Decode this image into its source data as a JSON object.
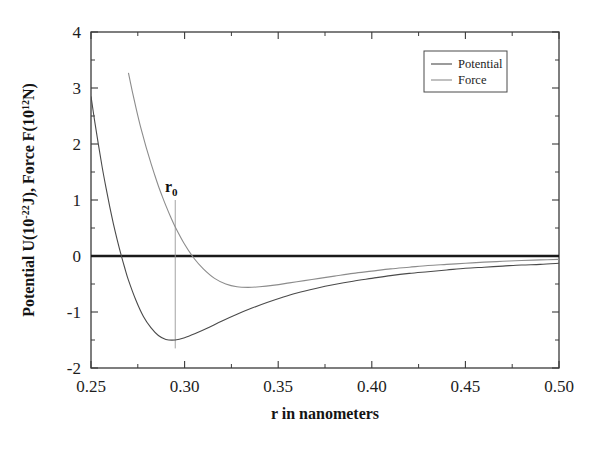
{
  "figure": {
    "background": "#ffffff",
    "frame_color": "#3a3a3a",
    "annotation": {
      "label": "r",
      "sub": "0",
      "value": 0.295
    }
  },
  "chart_data": {
    "type": "line",
    "title": "",
    "xlabel": "r in nanometers",
    "ylabel": "Potential U(10-22J),  Force F(1012N)",
    "ylabel_parts": {
      "p1": "Potential U(10",
      "p1_sup": "-22",
      "p2": "J),  Force F(10",
      "p2_sup": "12",
      "p3": "N)"
    },
    "xlim": [
      0.25,
      0.5
    ],
    "ylim": [
      -2,
      4
    ],
    "grid": false,
    "legend_position": "upper right",
    "xticks": [
      0.25,
      0.3,
      0.35,
      0.4,
      0.45,
      0.5
    ],
    "xtick_labels": [
      "0.25",
      "0.30",
      "0.35",
      "0.40",
      "0.45",
      "0.50"
    ],
    "x_minor_ticks": [
      0.275,
      0.325,
      0.375,
      0.425,
      0.475
    ],
    "yticks": [
      -2,
      -1,
      0,
      1,
      2,
      3,
      4
    ],
    "ytick_labels": [
      "-2",
      "-1",
      "0",
      "1",
      "2",
      "3",
      "4"
    ],
    "y_minor_ticks": [
      -1.5,
      -0.5,
      0.5,
      1.5,
      2.5,
      3.5
    ],
    "zero_line": {
      "y": 0,
      "color": "#1a1a1a",
      "width": 2.6
    },
    "series": [
      {
        "name": "Potential",
        "color": "#4a4a4a",
        "width": 1.1,
        "x": [
          0.25,
          0.252,
          0.254,
          0.256,
          0.258,
          0.26,
          0.262,
          0.264,
          0.266,
          0.268,
          0.27,
          0.274,
          0.278,
          0.282,
          0.286,
          0.29,
          0.295,
          0.3,
          0.306,
          0.312,
          0.32,
          0.328,
          0.336,
          0.344,
          0.352,
          0.36,
          0.37,
          0.38,
          0.39,
          0.4,
          0.41,
          0.42,
          0.43,
          0.44,
          0.45,
          0.46,
          0.47,
          0.48,
          0.49,
          0.5
        ],
        "y": [
          2.85,
          2.4,
          1.98,
          1.58,
          1.22,
          0.88,
          0.57,
          0.29,
          0.03,
          -0.21,
          -0.43,
          -0.79,
          -1.08,
          -1.28,
          -1.42,
          -1.49,
          -1.5,
          -1.46,
          -1.38,
          -1.29,
          -1.16,
          -1.04,
          -0.93,
          -0.83,
          -0.74,
          -0.66,
          -0.58,
          -0.51,
          -0.45,
          -0.4,
          -0.35,
          -0.31,
          -0.28,
          -0.25,
          -0.22,
          -0.2,
          -0.18,
          -0.16,
          -0.15,
          -0.13
        ]
      },
      {
        "name": "Force",
        "color": "#8c8c8c",
        "width": 1.1,
        "x": [
          0.27,
          0.272,
          0.274,
          0.276,
          0.278,
          0.28,
          0.282,
          0.284,
          0.286,
          0.288,
          0.29,
          0.2925,
          0.295,
          0.3,
          0.305,
          0.31,
          0.316,
          0.322,
          0.328,
          0.334,
          0.34,
          0.348,
          0.356,
          0.364,
          0.372,
          0.38,
          0.39,
          0.4,
          0.41,
          0.42,
          0.43,
          0.44,
          0.45,
          0.46,
          0.47,
          0.48,
          0.49,
          0.5
        ],
        "y": [
          3.27,
          2.95,
          2.65,
          2.37,
          2.12,
          1.88,
          1.66,
          1.45,
          1.25,
          1.07,
          0.9,
          0.7,
          0.52,
          0.21,
          -0.04,
          -0.23,
          -0.4,
          -0.5,
          -0.55,
          -0.56,
          -0.55,
          -0.52,
          -0.48,
          -0.44,
          -0.4,
          -0.36,
          -0.31,
          -0.27,
          -0.23,
          -0.2,
          -0.17,
          -0.15,
          -0.13,
          -0.11,
          -0.095,
          -0.08,
          -0.07,
          -0.06
        ]
      }
    ],
    "legend_entries": [
      "Potential",
      "Force"
    ]
  }
}
